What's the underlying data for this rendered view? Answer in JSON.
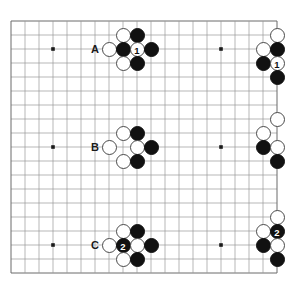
{
  "board": {
    "kind": "go-board-diagram",
    "grid": {
      "origin_x": 11,
      "origin_y": 21,
      "spacing": 14,
      "cols": 20,
      "rows": 19,
      "line_color": "#9a9a9a",
      "edge_color": "#6b6b6b",
      "background": "#ffffff"
    },
    "star_points": [
      {
        "x": 3,
        "y": 2
      },
      {
        "x": 15,
        "y": 2
      },
      {
        "x": 3,
        "y": 9
      },
      {
        "x": 15,
        "y": 9
      },
      {
        "x": 3,
        "y": 16
      },
      {
        "x": 15,
        "y": 16
      }
    ],
    "row_labels": [
      {
        "text": "A",
        "x": 6,
        "y": 2
      },
      {
        "text": "B",
        "x": 6,
        "y": 9
      },
      {
        "text": "C",
        "x": 6,
        "y": 16
      }
    ],
    "stones": [
      {
        "color": "white",
        "x": 8,
        "y": 1,
        "label": ""
      },
      {
        "color": "black",
        "x": 9,
        "y": 1,
        "label": ""
      },
      {
        "color": "white",
        "x": 7,
        "y": 2,
        "label": ""
      },
      {
        "color": "black",
        "x": 8,
        "y": 2,
        "label": ""
      },
      {
        "color": "white",
        "x": 9,
        "y": 2,
        "label": "1"
      },
      {
        "color": "black",
        "x": 10,
        "y": 2,
        "label": ""
      },
      {
        "color": "white",
        "x": 8,
        "y": 3,
        "label": ""
      },
      {
        "color": "black",
        "x": 9,
        "y": 3,
        "label": ""
      },
      {
        "color": "white",
        "x": 19,
        "y": 1,
        "label": ""
      },
      {
        "color": "white",
        "x": 18,
        "y": 2,
        "label": ""
      },
      {
        "color": "black",
        "x": 19,
        "y": 2,
        "label": ""
      },
      {
        "color": "black",
        "x": 18,
        "y": 3,
        "label": ""
      },
      {
        "color": "white",
        "x": 19,
        "y": 3,
        "label": "1"
      },
      {
        "color": "black",
        "x": 19,
        "y": 4,
        "label": ""
      },
      {
        "color": "white",
        "x": 8,
        "y": 8,
        "label": ""
      },
      {
        "color": "black",
        "x": 9,
        "y": 8,
        "label": ""
      },
      {
        "color": "white",
        "x": 7,
        "y": 9,
        "label": ""
      },
      {
        "color": "white",
        "x": 9,
        "y": 9,
        "label": ""
      },
      {
        "color": "black",
        "x": 10,
        "y": 9,
        "label": ""
      },
      {
        "color": "white",
        "x": 8,
        "y": 10,
        "label": ""
      },
      {
        "color": "black",
        "x": 9,
        "y": 10,
        "label": ""
      },
      {
        "color": "white",
        "x": 19,
        "y": 7,
        "label": ""
      },
      {
        "color": "white",
        "x": 18,
        "y": 8,
        "label": ""
      },
      {
        "color": "black",
        "x": 18,
        "y": 9,
        "label": ""
      },
      {
        "color": "white",
        "x": 19,
        "y": 9,
        "label": ""
      },
      {
        "color": "black",
        "x": 19,
        "y": 10,
        "label": ""
      },
      {
        "color": "white",
        "x": 8,
        "y": 15,
        "label": ""
      },
      {
        "color": "black",
        "x": 9,
        "y": 15,
        "label": ""
      },
      {
        "color": "white",
        "x": 7,
        "y": 16,
        "label": ""
      },
      {
        "color": "black",
        "x": 8,
        "y": 16,
        "label": "2"
      },
      {
        "color": "white",
        "x": 9,
        "y": 16,
        "label": ""
      },
      {
        "color": "black",
        "x": 10,
        "y": 16,
        "label": ""
      },
      {
        "color": "white",
        "x": 8,
        "y": 17,
        "label": ""
      },
      {
        "color": "black",
        "x": 9,
        "y": 17,
        "label": ""
      },
      {
        "color": "white",
        "x": 19,
        "y": 14,
        "label": ""
      },
      {
        "color": "white",
        "x": 18,
        "y": 15,
        "label": ""
      },
      {
        "color": "black",
        "x": 19,
        "y": 15,
        "label": "2"
      },
      {
        "color": "black",
        "x": 18,
        "y": 16,
        "label": ""
      },
      {
        "color": "white",
        "x": 19,
        "y": 16,
        "label": ""
      },
      {
        "color": "black",
        "x": 19,
        "y": 17,
        "label": ""
      }
    ]
  }
}
